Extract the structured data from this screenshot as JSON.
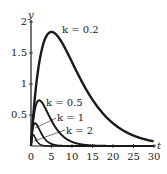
{
  "chart_data": {
    "type": "line",
    "title": "",
    "xlabel": "t",
    "ylabel": "y",
    "xlim": [
      0,
      30
    ],
    "ylim": [
      0,
      2
    ],
    "x_ticks": [
      "0",
      "5",
      "10",
      "15",
      "20",
      "25",
      "30"
    ],
    "y_ticks": [
      "0.5",
      "1",
      "1.5",
      "2"
    ],
    "grid": false,
    "function": "y = t*e^(-k t)",
    "series": [
      {
        "name": "k = 0.2",
        "k": 0.2,
        "peak_t": 5,
        "peak_y": 1.84,
        "x": [
          0,
          1,
          2,
          3,
          4,
          5,
          6,
          8,
          10,
          12,
          15,
          20,
          25,
          30
        ],
        "values": [
          0,
          0.82,
          1.34,
          1.65,
          1.8,
          1.84,
          1.81,
          1.62,
          1.35,
          1.09,
          0.75,
          0.37,
          0.17,
          0.07
        ]
      },
      {
        "name": "k = 0.5",
        "k": 0.5,
        "peak_t": 2,
        "peak_y": 0.74,
        "x": [
          0,
          1,
          2,
          3,
          4,
          6,
          8,
          10,
          12,
          15
        ],
        "values": [
          0,
          0.61,
          0.74,
          0.67,
          0.54,
          0.3,
          0.15,
          0.07,
          0.03,
          0.01
        ]
      },
      {
        "name": "k = 1",
        "k": 1,
        "peak_t": 1,
        "peak_y": 0.37,
        "x": [
          0,
          0.5,
          1,
          2,
          3,
          4,
          6,
          8
        ],
        "values": [
          0,
          0.3,
          0.37,
          0.27,
          0.15,
          0.07,
          0.01,
          0.0
        ]
      },
      {
        "name": "k = 2",
        "k": 2,
        "peak_t": 0.5,
        "peak_y": 0.18,
        "x": [
          0,
          0.25,
          0.5,
          1,
          2,
          3,
          4
        ],
        "values": [
          0,
          0.15,
          0.18,
          0.14,
          0.04,
          0.01,
          0.0
        ]
      }
    ],
    "annotations": [
      "k = 0.2",
      "k = 0.5",
      "k = 1",
      "k = 2"
    ]
  },
  "labels": {
    "x_axis": "t",
    "y_axis": "y",
    "k02": "k = 0.2",
    "k05": "k = 0.5",
    "k1": "k = 1",
    "k2": "k = 2",
    "xt0": "0",
    "xt5": "5",
    "xt10": "10",
    "xt15": "15",
    "xt20": "20",
    "xt25": "25",
    "xt30": "30",
    "yt05": "0.5",
    "yt1": "1",
    "yt15": "1.5",
    "yt2": "2"
  }
}
